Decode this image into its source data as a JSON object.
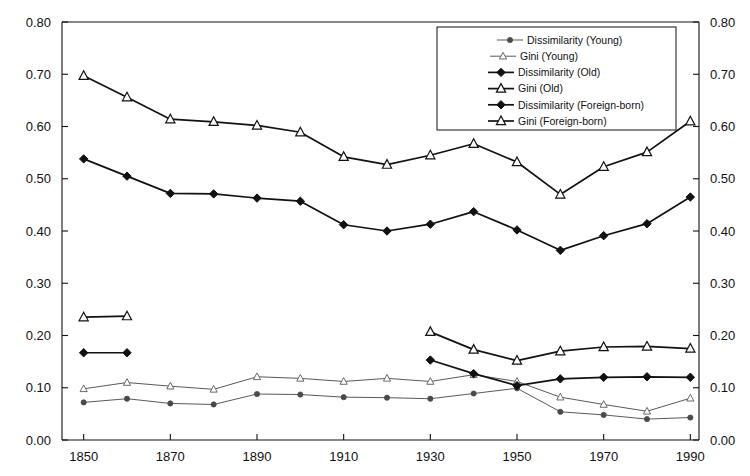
{
  "chart_data": {
    "type": "line",
    "title": "",
    "subtitle": "",
    "xlabel": "",
    "ylabel": "",
    "xlim": [
      1845,
      1992
    ],
    "ylim": [
      0.0,
      0.8
    ],
    "grid": false,
    "legend_position": "top-right",
    "dual_y_axis": true,
    "x_tick_labels": [
      "1850",
      "1870",
      "1890",
      "1910",
      "1930",
      "1950",
      "1970",
      "1990"
    ],
    "x_tick_values": [
      1850,
      1870,
      1890,
      1910,
      1930,
      1950,
      1970,
      1990
    ],
    "y_tick_labels": [
      "0.00",
      "0.10",
      "0.20",
      "0.30",
      "0.40",
      "0.50",
      "0.60",
      "0.70",
      "0.80"
    ],
    "y_tick_values": [
      0.0,
      0.1,
      0.2,
      0.3,
      0.4,
      0.5,
      0.6,
      0.7,
      0.8
    ],
    "y_tick_labels_right": [
      "0.00",
      "0.10",
      "0.20",
      "0.30",
      "0.40",
      "0.50",
      "0.60",
      "0.70",
      "0.80"
    ],
    "series": [
      {
        "name": "Dissimilarity (Young)",
        "marker": "circle-filled-small",
        "style": "thin",
        "x": [
          1850,
          1860,
          1870,
          1880,
          1890,
          1900,
          1910,
          1920,
          1930,
          1940,
          1950,
          1960,
          1970,
          1980,
          1990
        ],
        "values": [
          0.072,
          0.079,
          0.07,
          0.068,
          0.088,
          0.087,
          0.082,
          0.081,
          0.079,
          0.089,
          0.099,
          0.054,
          0.048,
          0.04,
          0.043
        ]
      },
      {
        "name": "Gini (Young)",
        "marker": "triangle-open-small",
        "style": "thin",
        "x": [
          1850,
          1860,
          1870,
          1880,
          1890,
          1900,
          1910,
          1920,
          1930,
          1940,
          1950,
          1960,
          1970,
          1980,
          1990
        ],
        "values": [
          0.098,
          0.11,
          0.103,
          0.097,
          0.121,
          0.118,
          0.112,
          0.118,
          0.112,
          0.125,
          0.112,
          0.082,
          0.068,
          0.055,
          0.08
        ]
      },
      {
        "name": "Dissimilarity (Old)",
        "marker": "diamond-filled",
        "style": "thick",
        "x": [
          1850,
          1860,
          1870,
          1880,
          1890,
          1900,
          1910,
          1920,
          1930,
          1940,
          1950,
          1960,
          1970,
          1980,
          1990
        ],
        "values": [
          0.538,
          0.505,
          0.472,
          0.471,
          0.463,
          0.457,
          0.412,
          0.4,
          0.413,
          0.437,
          0.402,
          0.363,
          0.391,
          0.414,
          0.465
        ]
      },
      {
        "name": "Gini (Old)",
        "marker": "triangle-open",
        "style": "thick",
        "x": [
          1850,
          1860,
          1870,
          1880,
          1890,
          1900,
          1910,
          1920,
          1930,
          1940,
          1950,
          1960,
          1970,
          1980,
          1990
        ],
        "values": [
          0.697,
          0.656,
          0.614,
          0.609,
          0.602,
          0.589,
          0.542,
          0.527,
          0.545,
          0.567,
          0.532,
          0.47,
          0.523,
          0.551,
          0.61
        ]
      },
      {
        "name": "Dissimilarity (Foreign-born)",
        "marker": "diamond-filled",
        "style": "thick",
        "x": [
          1850,
          1860,
          1930,
          1940,
          1950,
          1960,
          1970,
          1980,
          1990
        ],
        "values": [
          0.167,
          0.167,
          0.153,
          0.127,
          0.104,
          0.117,
          0.12,
          0.121,
          0.12
        ]
      },
      {
        "name": "Gini (Foreign-born)",
        "marker": "triangle-open",
        "style": "thick",
        "x": [
          1850,
          1860,
          1930,
          1940,
          1950,
          1960,
          1970,
          1980,
          1990
        ],
        "values": [
          0.235,
          0.237,
          0.207,
          0.173,
          0.152,
          0.17,
          0.178,
          0.179,
          0.175
        ]
      }
    ],
    "legend_entries": [
      "Dissimilarity (Young)",
      "Gini (Young)",
      "Dissimilarity (Old)",
      "Gini (Old)",
      "Dissimilarity (Foreign-born)",
      "Gini (Foreign-born)"
    ],
    "colors": {
      "line": "#111111",
      "line_thin": "#5a5a5a",
      "marker_fill": "#111111",
      "marker_open_fill": "#ffffff",
      "axis": "#111111",
      "background": "#ffffff"
    }
  }
}
